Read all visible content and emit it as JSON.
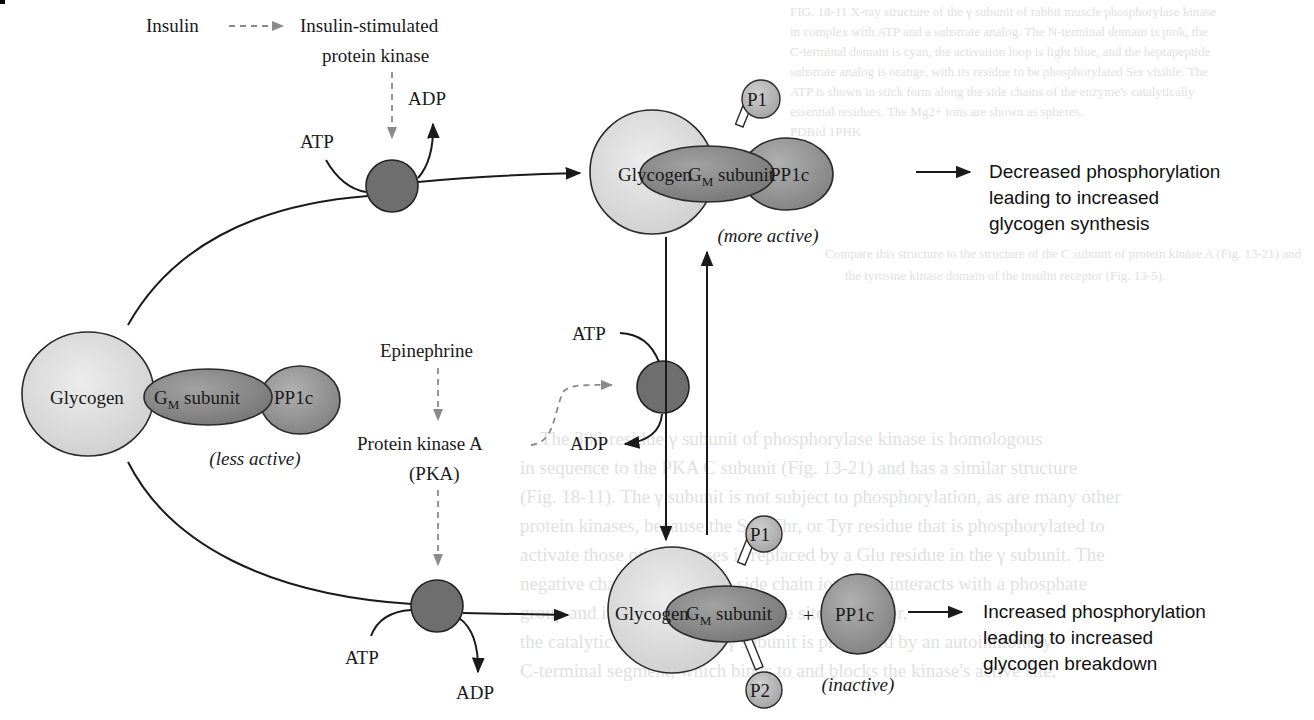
{
  "background_text": {
    "caption_lines": [
      "FIG. 18-11 X-ray structure of the γ subunit of rabbit muscle phosphorylase kinase",
      "in complex with ATP and a substrate analog. The N-terminal domain is pink, the",
      "C-terminal domain is cyan, the activation loop is light blue, and the heptapeptide",
      "substrate analog is orange, with its residue to be phosphorylated Ser visible. The",
      "ATP is shown in stick form along the side chains of the enzyme's catalytically",
      "essential residues. The Mg2+ ions are shown as spheres.",
      "PDBid 1PHK",
      "Compare this structure to the structure of the C subunit of protein kinase A (Fig. 13-21) and",
      "the tyrosine kinase domain of the insulin receptor (Fig. 13-5)."
    ],
    "body_lines": [
      "The 386-residue γ subunit of phosphorylase kinase is homologous",
      "in sequence to the PKA C subunit (Fig. 13-21) and has a similar structure",
      "(Fig. 18-11). The γ subunit is not subject to phosphorylation, as are many other",
      "protein kinases, because the Ser, Thr, or Tyr residue that is phosphorylated to",
      "activate those other kinases is replaced by a Glu residue in the γ subunit. The",
      "negative charge of the Glu's side chain ionically interacts with a phosphate",
      "group and is conserved in the active site. However,",
      "the catalytic activity of the γ subunit is prevented by an autoinhibitory",
      "C-terminal segment, which binds to and blocks the kinase's active site."
    ]
  },
  "signals": {
    "insulin": "Insulin",
    "insulin_kinase_line1": "Insulin-stimulated",
    "insulin_kinase_line2": "protein kinase",
    "epinephrine": "Epinephrine",
    "pka_line1": "Protein kinase A",
    "pka_line2": "(PKA)"
  },
  "cofactors": {
    "atp": "ATP",
    "adp": "ADP"
  },
  "complexes": {
    "left": {
      "glycogen": "Glycogen",
      "gm_base": "G",
      "gm_sub": "M",
      "gm_suffix": " subunit",
      "pp1c": "PP1c",
      "state": "less active"
    },
    "top": {
      "glycogen": "Glycogen",
      "gm_base": "G",
      "gm_sub": "M",
      "gm_suffix": " subunit",
      "pp1c": "PP1c",
      "phospho1": "P1",
      "state": "more active"
    },
    "bottom": {
      "glycogen": "Glycogen",
      "gm_base": "G",
      "gm_sub": "M",
      "gm_suffix": " subunit",
      "plus": "+",
      "pp1c": "PP1c",
      "phospho1": "P1",
      "phospho2": "P2",
      "state": "inactive"
    }
  },
  "outcomes": {
    "top": [
      "Decreased phosphorylation",
      "leading to increased",
      "glycogen synthesis"
    ],
    "bottom": [
      "Increased phosphorylation",
      "leading to increased",
      "glycogen breakdown"
    ]
  },
  "colors": {
    "glycogen_fill": "#dcdcdc",
    "gm_fill": "#8c8c8c",
    "pp1c_fill": "#9a9a9a",
    "kinase_fill": "#6e6e6e",
    "phospho_fill": "#b8b8b8",
    "dashed_arrow": "#8a8a8a"
  }
}
